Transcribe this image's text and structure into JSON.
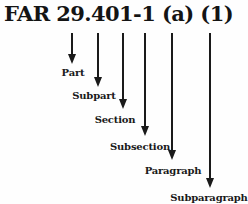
{
  "title": "FAR 29.401-1 (a) (1)",
  "colors": {
    "ink": "#1a1a1a",
    "background": "#fefefe"
  },
  "geometry": {
    "line_top": 33,
    "line_width": 2,
    "head_width": 8,
    "head_height": 10
  },
  "arrows": [
    {
      "label": "Part",
      "points_to": "29",
      "x": 72,
      "tip_y": 64,
      "label_x": 73,
      "label_y": 67
    },
    {
      "label": "Subpart",
      "points_to": "4",
      "x": 98,
      "tip_y": 87,
      "label_x": 94,
      "label_y": 90
    },
    {
      "label": "Section",
      "points_to": "401",
      "x": 123,
      "tip_y": 109,
      "label_x": 115,
      "label_y": 114
    },
    {
      "label": "Subsection",
      "points_to": "-1",
      "x": 145,
      "tip_y": 136,
      "label_x": 140,
      "label_y": 141
    },
    {
      "label": "Paragraph",
      "points_to": "(a)",
      "x": 172,
      "tip_y": 160,
      "label_x": 173,
      "label_y": 165
    },
    {
      "label": "Subparagraph",
      "points_to": "(1)",
      "x": 210,
      "tip_y": 188,
      "label_x": 209,
      "label_y": 192
    }
  ]
}
